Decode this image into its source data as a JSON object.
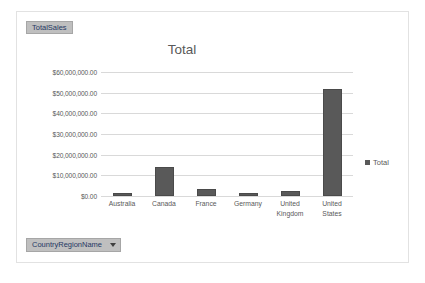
{
  "pivot": {
    "values_field_button": "TotalSales",
    "axis_field_button": "CountryRegionName",
    "axis_field_dropdown_icon": "chevron-down-icon"
  },
  "legend": {
    "label": "Total",
    "marker_icon": "square-marker-icon",
    "position": "right"
  },
  "colors": {
    "bar": "#595959",
    "gridline": "#d9d9d9",
    "field_button_bg": "#bfbfbf",
    "field_button_text": "#1f3864",
    "axis_text": "#595959",
    "frame_border": "#e2e2e2"
  },
  "chart_data": {
    "type": "bar",
    "title": "Total",
    "xlabel": "",
    "ylabel": "",
    "categories": [
      "Australia",
      "Canada",
      "France",
      "Germany",
      "United Kingdom",
      "United States"
    ],
    "series": [
      {
        "name": "Total",
        "values": [
          1500000,
          14000000,
          3400000,
          1500000,
          2400000,
          52000000
        ]
      }
    ],
    "ylim": [
      0,
      60000000
    ],
    "ytick_values": [
      0,
      10000000,
      20000000,
      30000000,
      40000000,
      50000000,
      60000000
    ],
    "ytick_labels": [
      "$0.00",
      "$10,000,000.00",
      "$20,000,000.00",
      "$30,000,000.00",
      "$40,000,000.00",
      "$50,000,000.00",
      "$60,000,000.00"
    ],
    "grid": true,
    "legend": [
      "Total"
    ],
    "legend_position": "right"
  }
}
